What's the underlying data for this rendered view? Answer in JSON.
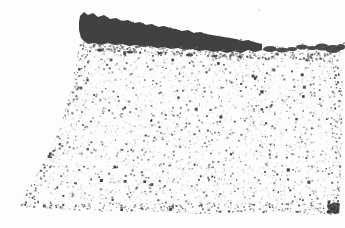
{
  "image": {
    "alt": "Grayscale micrograph of a porous speckled granular material with a dark surface layer along the top, thick at the left and tapering into fragments toward the right; dense dark cluster at bottom-right corner",
    "width": 345,
    "height": 228,
    "seed": 20240613,
    "colors": {
      "background": "#fdfdfd",
      "band": "#414141",
      "light_dots": [
        "#d4d4d4",
        "#c9c9c9",
        "#dedede",
        "#bfbfbf",
        "#e3e3e3"
      ],
      "dark_dots": [
        "#2e2e2e",
        "#3c3c3c",
        "#4a4a4a",
        "#5a5a5a",
        "#6e6e6e",
        "#8a8a8a"
      ],
      "transition_dots": [
        "#3c3c3c",
        "#4a4a4a",
        "#5a5a5a",
        "#6e6e6e"
      ],
      "pale_blob": "#e6e6e6",
      "stray": "#d9d9d9"
    },
    "region_polygon": [
      [
        80,
        42
      ],
      [
        120,
        43
      ],
      [
        160,
        46
      ],
      [
        200,
        50
      ],
      [
        240,
        53
      ],
      [
        270,
        54
      ],
      [
        300,
        57
      ],
      [
        320,
        56
      ],
      [
        342,
        53
      ],
      [
        343,
        110
      ],
      [
        341,
        165
      ],
      [
        339,
        214
      ],
      [
        300,
        215
      ],
      [
        250,
        212
      ],
      [
        200,
        214
      ],
      [
        150,
        211
      ],
      [
        100,
        212
      ],
      [
        60,
        209
      ],
      [
        18,
        207
      ],
      [
        26,
        192
      ],
      [
        36,
        176
      ],
      [
        46,
        158
      ],
      [
        55,
        140
      ],
      [
        63,
        118
      ],
      [
        69,
        96
      ],
      [
        74,
        72
      ],
      [
        78,
        52
      ]
    ],
    "band_top": [
      [
        80,
        16
      ],
      [
        84,
        12
      ],
      [
        88,
        15
      ],
      [
        93,
        13
      ],
      [
        98,
        17
      ],
      [
        104,
        15
      ],
      [
        110,
        19
      ],
      [
        116,
        18
      ],
      [
        122,
        21
      ],
      [
        128,
        20
      ],
      [
        134,
        23
      ],
      [
        140,
        22
      ],
      [
        146,
        25
      ],
      [
        152,
        24
      ],
      [
        158,
        27
      ],
      [
        164,
        26
      ],
      [
        170,
        28
      ],
      [
        176,
        29
      ],
      [
        182,
        31
      ],
      [
        188,
        30
      ],
      [
        194,
        33
      ],
      [
        200,
        32
      ],
      [
        206,
        34
      ],
      [
        212,
        35
      ],
      [
        218,
        36
      ],
      [
        224,
        37
      ],
      [
        230,
        38
      ],
      [
        236,
        39
      ],
      [
        242,
        41
      ],
      [
        248,
        40
      ],
      [
        254,
        42
      ],
      [
        258,
        43
      ],
      [
        262,
        44
      ]
    ],
    "band_bottom": [
      [
        79,
        22
      ],
      [
        79,
        30
      ],
      [
        81,
        38
      ],
      [
        84,
        41
      ],
      [
        88,
        44
      ],
      [
        94,
        43
      ],
      [
        101,
        45
      ],
      [
        108,
        43
      ],
      [
        115,
        45
      ],
      [
        122,
        44
      ],
      [
        129,
        46
      ],
      [
        136,
        45
      ],
      [
        143,
        47
      ],
      [
        150,
        46
      ],
      [
        157,
        48
      ],
      [
        164,
        47
      ],
      [
        171,
        49
      ],
      [
        178,
        48
      ],
      [
        185,
        50
      ],
      [
        192,
        49
      ],
      [
        199,
        51
      ],
      [
        206,
        50
      ],
      [
        213,
        52
      ],
      [
        220,
        51
      ],
      [
        227,
        53
      ],
      [
        234,
        51
      ],
      [
        241,
        53
      ],
      [
        248,
        50
      ],
      [
        255,
        52
      ],
      [
        262,
        50
      ]
    ],
    "fragments": [
      {
        "x": 270,
        "y": 49,
        "rx": 7,
        "ry": 3
      },
      {
        "x": 282,
        "y": 50,
        "rx": 6,
        "ry": 2.5
      },
      {
        "x": 292,
        "y": 49,
        "rx": 5,
        "ry": 2
      },
      {
        "x": 302,
        "y": 47,
        "rx": 6,
        "ry": 2.5
      },
      {
        "x": 312,
        "y": 48,
        "rx": 5,
        "ry": 2
      },
      {
        "x": 322,
        "y": 47,
        "rx": 7,
        "ry": 3.5
      },
      {
        "x": 333,
        "y": 49,
        "rx": 8,
        "ry": 4
      },
      {
        "x": 341,
        "y": 47,
        "rx": 4,
        "ry": 3
      },
      {
        "x": 100,
        "y": 50,
        "rx": 3,
        "ry": 1.5
      },
      {
        "x": 130,
        "y": 52,
        "rx": 3,
        "ry": 1.5
      },
      {
        "x": 160,
        "y": 53,
        "rx": 2.5,
        "ry": 1.2
      },
      {
        "x": 190,
        "y": 55,
        "rx": 3,
        "ry": 1.5
      },
      {
        "x": 215,
        "y": 56,
        "rx": 2.5,
        "ry": 1.2
      },
      {
        "x": 240,
        "y": 57,
        "rx": 2,
        "ry": 1
      }
    ],
    "corner_cluster": {
      "x": 336,
      "y": 208,
      "spread_x": 10,
      "spread_y": 8,
      "dots": 70
    },
    "stray_specks": [
      {
        "x": 258,
        "y": 9,
        "s": 2
      }
    ],
    "edges": {
      "bottom_strip": {
        "x_min": 14,
        "x_max": 344,
        "y_min": 202,
        "y_max": 215
      },
      "left_line": {
        "from": [
          18,
          207
        ],
        "to": [
          80,
          44
        ],
        "jitter_in": 16
      },
      "right_strip": {
        "x_min": 330,
        "x_max": 343,
        "y_min": 55,
        "y_max": 215
      }
    },
    "band_profile": {
      "top": {
        "x0": 80,
        "y0": 15,
        "slope": 0.159,
        "x_end": 262
      },
      "bottom": {
        "x0": 80,
        "y0": 42,
        "slope": 0.05,
        "x_end": 330
      }
    },
    "counts": {
      "interior_light": 2400,
      "interior_pale_blobs": 500,
      "interior_dark": 1300,
      "interior_large_dark": 45,
      "bottom_edge": 280,
      "left_edge": 120,
      "right_edge": 90,
      "band_top_rough": 90,
      "band_bottom_rough": 280,
      "fragment_scatter_per": 8
    }
  }
}
